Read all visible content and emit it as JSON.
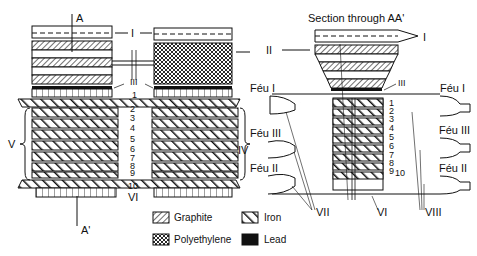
{
  "diagram": {
    "section_title": "Section through AA'",
    "section_markers": {
      "top": "A",
      "bottom": "A'"
    },
    "left_view": {
      "labels": {
        "I": "I",
        "II": "II",
        "III": "III",
        "IV": "IV",
        "V": "V",
        "VI": "VI"
      },
      "layer_numbers": [
        "1",
        "2",
        "3",
        "4",
        "5",
        "6",
        "7",
        "8",
        "9",
        "10"
      ]
    },
    "right_view": {
      "labels": {
        "I": "I",
        "III": "III",
        "VI": "VI",
        "VII": "VII",
        "VIII": "VIII"
      },
      "feu_labels": {
        "left": [
          "Féu I",
          "Féu III",
          "Féu II"
        ],
        "right": [
          "Féu I",
          "Féu III",
          "Féu II"
        ]
      },
      "layer_numbers": [
        "1",
        "2",
        "3",
        "4",
        "5",
        "6",
        "7",
        "8",
        "9",
        "10"
      ]
    },
    "legend": [
      {
        "name": "Graphite",
        "pattern": "fine-diagonal-hatch"
      },
      {
        "name": "Iron",
        "pattern": "bold-diagonal-hatch"
      },
      {
        "name": "Polyethylene",
        "pattern": "cross-hatch"
      },
      {
        "name": "Lead",
        "pattern": "solid-black"
      }
    ],
    "colors": {
      "ink": "#111111",
      "paper": "#ffffff"
    }
  }
}
